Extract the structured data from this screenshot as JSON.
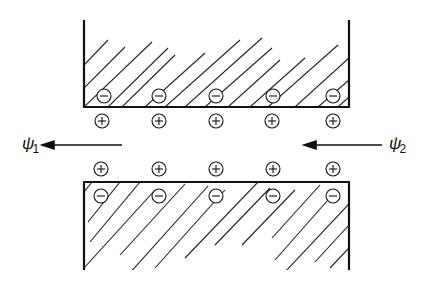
{
  "diagram": {
    "labels": {
      "left": {
        "symbol": "ψ",
        "subscript": "1"
      },
      "right": {
        "symbol": "ψ",
        "subscript": "2"
      }
    },
    "top_wall": {
      "wall_charges": [
        "−",
        "−",
        "−",
        "−",
        "−"
      ],
      "counter_ions": [
        "+",
        "+",
        "+",
        "+",
        "+"
      ]
    },
    "bottom_wall": {
      "wall_charges": [
        "−",
        "−",
        "−",
        "−",
        "−"
      ],
      "counter_ions": [
        "+",
        "+",
        "+",
        "+",
        "+"
      ]
    },
    "arrows": [
      {
        "name": "left-arrow",
        "direction": "left"
      },
      {
        "name": "right-arrow",
        "direction": "left"
      }
    ],
    "colors": {
      "ink": "#111111",
      "background": "#ffffff"
    }
  }
}
